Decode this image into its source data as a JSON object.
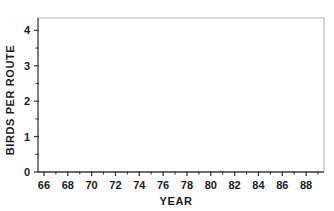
{
  "chart_data": {
    "type": "line",
    "title": "",
    "xlabel": "YEAR",
    "ylabel": "BIRDS PER ROUTE",
    "xlim": [
      65.5,
      89.5
    ],
    "ylim": [
      0,
      4.35
    ],
    "grid": false,
    "legend": null,
    "x_major_ticks": [
      66,
      68,
      70,
      72,
      74,
      76,
      78,
      80,
      82,
      84,
      86,
      88
    ],
    "x_major_tick_labels": [
      "66",
      "68",
      "70",
      "72",
      "74",
      "76",
      "78",
      "80",
      "82",
      "84",
      "86",
      "88"
    ],
    "x_minor_ticks": [
      67,
      69,
      71,
      73,
      75,
      77,
      79,
      81,
      83,
      85,
      87,
      89
    ],
    "y_major_ticks": [
      0,
      1,
      2,
      3,
      4
    ],
    "y_major_tick_labels": [
      "0",
      "1",
      "2",
      "3",
      "4"
    ],
    "y_minor_ticks": [
      0.5,
      1.5,
      2.5,
      3.5
    ],
    "x": [
      1966,
      1967,
      1968,
      1969,
      1970,
      1971,
      1972,
      1973,
      1974,
      1975,
      1976,
      1977,
      1978,
      1979,
      1980,
      1981,
      1982,
      1983,
      1984,
      1985,
      1986,
      1987,
      1988,
      1989
    ],
    "categories": [
      "66",
      "67",
      "68",
      "69",
      "70",
      "71",
      "72",
      "73",
      "74",
      "75",
      "76",
      "77",
      "78",
      "79",
      "80",
      "81",
      "82",
      "83",
      "84",
      "85",
      "86",
      "87",
      "88",
      "89"
    ],
    "values": [
      0.61,
      0.75,
      0.9,
      0.9,
      1.0,
      1.09,
      1.0,
      1.06,
      1.09,
      1.29,
      1.19,
      1.28,
      2.1,
      1.45,
      1.76,
      1.67,
      2.17,
      2.07,
      2.27,
      1.98,
      2.21,
      2.41,
      2.78,
      4.05
    ],
    "series": [
      {
        "name": "Birds per route",
        "color": "#1a1a1a",
        "values": [
          0.61,
          0.75,
          0.9,
          0.9,
          1.0,
          1.09,
          1.0,
          1.06,
          1.09,
          1.29,
          1.19,
          1.28,
          2.1,
          1.45,
          1.76,
          1.67,
          2.17,
          2.07,
          2.27,
          1.98,
          2.21,
          2.41,
          2.78,
          4.05
        ]
      }
    ]
  },
  "style": {
    "line_color": "#1a1a1a",
    "axis_color": "#4a4a4a",
    "frame_color": "#b9b9b9",
    "background": "#ffffff"
  }
}
